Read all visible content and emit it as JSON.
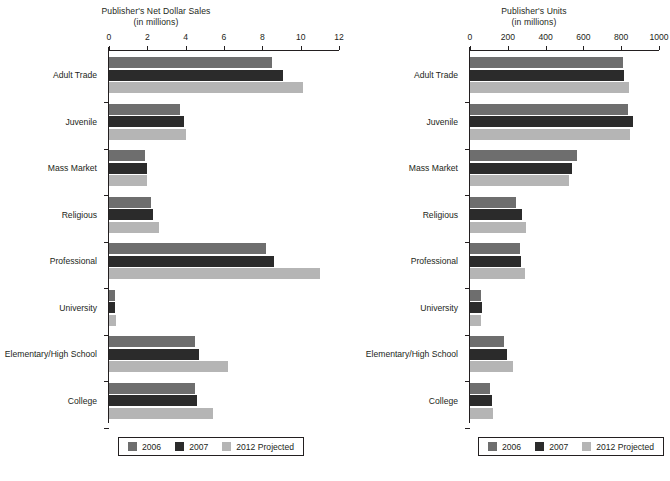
{
  "chart_data": [
    {
      "type": "bar",
      "orientation": "horizontal",
      "title": "Publisher's Net Dollar Sales",
      "subtitle": "(in millions)",
      "xlabel": "",
      "ylabel": "",
      "xlim": [
        0,
        12
      ],
      "xticks": [
        0,
        2,
        4,
        6,
        8,
        10,
        12
      ],
      "grid": false,
      "legend_position": "bottom",
      "categories": [
        "Adult Trade",
        "Juvenile",
        "Mass Market",
        "Religious",
        "Professional",
        "University",
        "Elementary/High School",
        "College"
      ],
      "series": [
        {
          "name": "2006",
          "color": "#6e6e6e",
          "values": [
            8.5,
            3.7,
            1.9,
            2.2,
            8.2,
            0.3,
            4.5,
            4.5
          ]
        },
        {
          "name": "2007",
          "color": "#2b2b2b",
          "values": [
            9.1,
            3.9,
            2.0,
            2.3,
            8.6,
            0.3,
            4.7,
            4.6
          ]
        },
        {
          "name": "2012 Projected",
          "color": "#b5b5b5",
          "values": [
            10.1,
            4.0,
            2.0,
            2.6,
            11.0,
            0.35,
            6.2,
            5.4
          ]
        }
      ]
    },
    {
      "type": "bar",
      "orientation": "horizontal",
      "title": "Publisher's Units",
      "subtitle": "(in millions)",
      "xlabel": "",
      "ylabel": "",
      "xlim": [
        0,
        1000
      ],
      "xticks": [
        0,
        200,
        400,
        600,
        800,
        1000
      ],
      "grid": false,
      "legend_position": "bottom",
      "categories": [
        "Adult Trade",
        "Juvenile",
        "Mass Market",
        "Religious",
        "Professional",
        "University",
        "Elementary/High School",
        "College"
      ],
      "series": [
        {
          "name": "2006",
          "color": "#6e6e6e",
          "values": [
            810,
            835,
            565,
            245,
            265,
            60,
            180,
            105
          ]
        },
        {
          "name": "2007",
          "color": "#2b2b2b",
          "values": [
            815,
            860,
            540,
            276,
            272,
            62,
            198,
            115
          ]
        },
        {
          "name": "2012 Projected",
          "color": "#b5b5b5",
          "values": [
            840,
            845,
            525,
            298,
            290,
            58,
            226,
            120
          ]
        }
      ]
    }
  ],
  "legend": {
    "items": [
      {
        "label": "2006",
        "color": "#6e6e6e"
      },
      {
        "label": "2007",
        "color": "#2b2b2b"
      },
      {
        "label": "2012 Projected",
        "color": "#b5b5b5"
      }
    ]
  }
}
